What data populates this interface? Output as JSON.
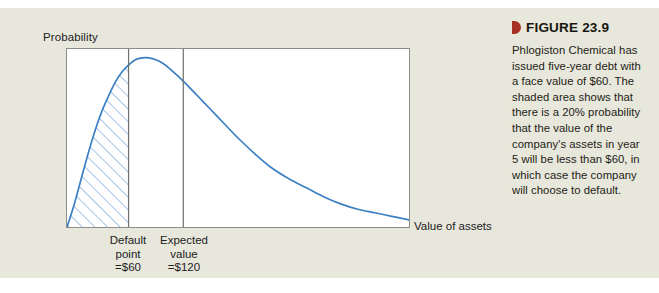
{
  "figure": {
    "marker_color": "#a63122",
    "title": "FIGURE 23.9",
    "caption": "Phlogiston Chemical has issued five-year debt with a face value of $60. The shaded area shows that there is a 20% probability that the value of the company's assets in year 5 will be less than $60, in which case the company will choose to default."
  },
  "chart_data": {
    "type": "area",
    "title": "",
    "xlabel": "Value of assets",
    "ylabel": "Probability",
    "grid": false,
    "legend": null,
    "curve_color": "#3b7fc4",
    "shade_color": "#5b93cc",
    "marker_line_color": "#6f6f6a",
    "frame_color": "#8d8d88",
    "plot_background": "#ffffff",
    "xlim": [
      0,
      100
    ],
    "ylim": [
      0,
      100
    ],
    "series": [
      {
        "name": "Probability distribution of asset value",
        "x": [
          0,
          2,
          4,
          6,
          8,
          10,
          12,
          14,
          16,
          18,
          20,
          22,
          24,
          26,
          28,
          30,
          34,
          38,
          42,
          46,
          50,
          55,
          60,
          65,
          70,
          75,
          80,
          85,
          90,
          95,
          100
        ],
        "y": [
          0,
          12,
          26,
          40,
          53,
          64,
          73,
          81,
          87,
          91,
          94,
          95,
          95,
          94,
          92,
          89,
          82,
          74,
          66,
          58,
          50,
          41,
          33,
          27,
          22,
          17,
          13,
          10,
          8,
          6,
          4
        ]
      }
    ],
    "shaded_region": {
      "label": "Default region",
      "x_from": 0,
      "x_to": 18,
      "probability_percent": 20,
      "hatch": "diagonal"
    },
    "vertical_markers": [
      {
        "name": "default-point",
        "x": 18,
        "label_lines": [
          "Default",
          "point",
          "=$60"
        ],
        "value": 60
      },
      {
        "name": "expected-value",
        "x": 34,
        "label_lines": [
          "Expected",
          "value",
          "=$120"
        ],
        "value": 120
      }
    ]
  }
}
